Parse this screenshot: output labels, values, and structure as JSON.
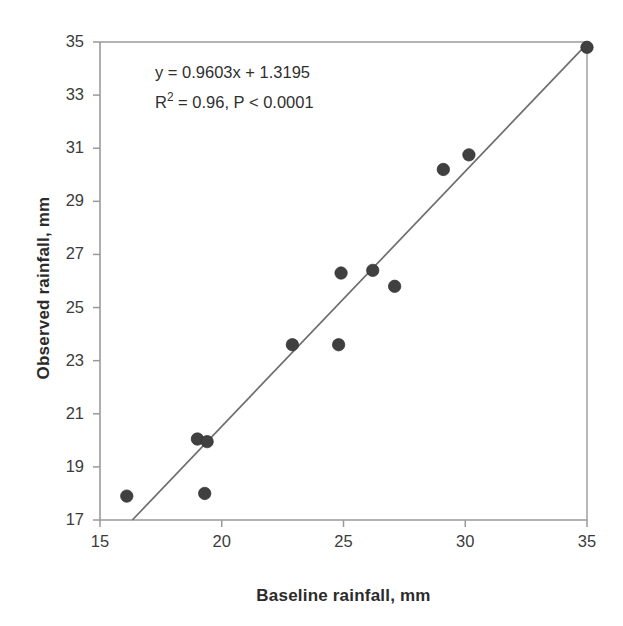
{
  "chart_data": {
    "type": "scatter",
    "title": "",
    "xlabel": "Baseline rainfall, mm",
    "ylabel": "Observed rainfall, mm",
    "xlim": [
      15,
      35
    ],
    "ylim": [
      17,
      35
    ],
    "xticks": [
      15,
      20,
      25,
      30,
      35
    ],
    "yticks": [
      17,
      19,
      21,
      23,
      25,
      27,
      29,
      31,
      33,
      35
    ],
    "grid": false,
    "legend": null,
    "marker_color": "#404040",
    "line_color": "#6e6e6e",
    "axis_color": "#9a9a9a",
    "series": [
      {
        "name": "Observed vs baseline rainfall",
        "points": [
          {
            "x": 16.1,
            "y": 17.9
          },
          {
            "x": 19.0,
            "y": 20.05
          },
          {
            "x": 19.4,
            "y": 19.95
          },
          {
            "x": 19.3,
            "y": 18.0
          },
          {
            "x": 22.9,
            "y": 23.6
          },
          {
            "x": 24.8,
            "y": 23.6
          },
          {
            "x": 24.9,
            "y": 26.3
          },
          {
            "x": 26.2,
            "y": 26.4
          },
          {
            "x": 27.1,
            "y": 25.8
          },
          {
            "x": 29.1,
            "y": 30.2
          },
          {
            "x": 30.15,
            "y": 30.75
          },
          {
            "x": 35.0,
            "y": 34.8
          }
        ]
      }
    ],
    "trendline": {
      "type": "linear",
      "slope": 0.9603,
      "intercept": 1.3195,
      "equation": "y = 0.9603x + 1.3195",
      "r_squared": 0.96,
      "p_value": "< 0.0001"
    },
    "annotations": {
      "equation_line": "y = 0.9603x + 1.3195",
      "stats_prefix": "R",
      "stats_exponent": "2",
      "stats_rest": " = 0.96, P < 0.0001"
    }
  },
  "tick_labels": {
    "y": [
      "35",
      "33",
      "31",
      "29",
      "27",
      "25",
      "23",
      "21",
      "19",
      "17"
    ],
    "x": [
      "15",
      "20",
      "25",
      "30",
      "35"
    ]
  },
  "axes": {
    "x_title": "Baseline rainfall, mm",
    "y_title": "Observed rainfall, mm"
  }
}
